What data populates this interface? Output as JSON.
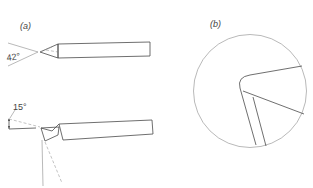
{
  "figure": {
    "panel_a": {
      "label": "(a)",
      "top_view": {
        "angle_label": "42°"
      },
      "side_view": {
        "angle_label": "15°"
      }
    },
    "panel_b": {
      "label": "(b)",
      "description": "magnified circular detail of rounded cutting tool nose"
    }
  },
  "colors": {
    "line": "#4a4a4a",
    "construction_line": "#8a8a8a",
    "background": "#ffffff"
  }
}
